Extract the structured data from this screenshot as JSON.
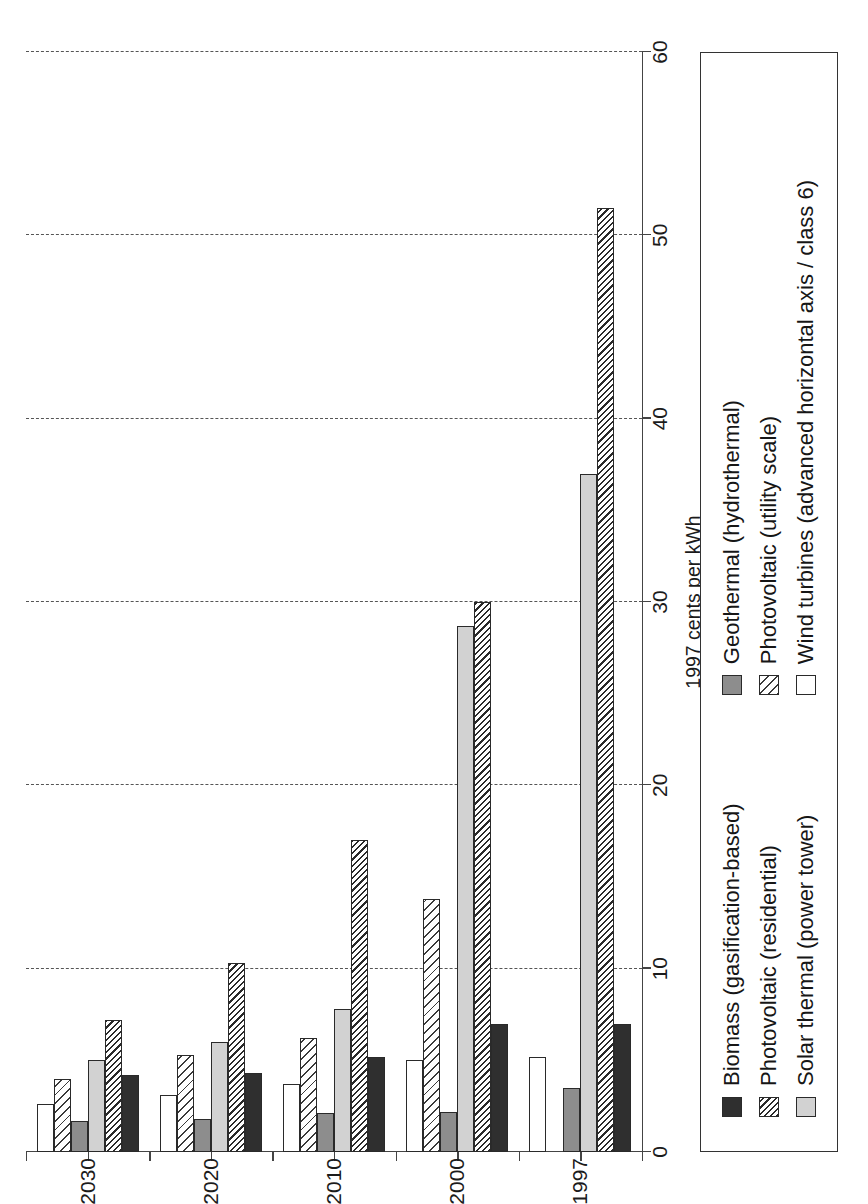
{
  "chart_data": {
    "type": "bar",
    "orientation": "horizontal",
    "title": "",
    "xlabel": "1997 cents per kWh",
    "ylabel": "",
    "categories": [
      "1997",
      "2000",
      "2010",
      "2020",
      "2030"
    ],
    "xlim": [
      0,
      60
    ],
    "xticks": [
      0,
      10,
      20,
      30,
      40,
      50,
      60
    ],
    "grid": true,
    "legend_position": "below-plot",
    "series": [
      {
        "name": "Biomass (gasification-based)",
        "fill": "solid-dark",
        "values": [
          7.0,
          7.0,
          5.2,
          4.3,
          4.2
        ]
      },
      {
        "name": "Photovoltaic (residential)",
        "fill": "dense-hatch",
        "values": [
          51.5,
          30.0,
          17.0,
          10.3,
          7.2
        ]
      },
      {
        "name": "Solar thermal (power tower)",
        "fill": "light-tone",
        "values": [
          37.0,
          28.7,
          7.8,
          6.0,
          5.0
        ]
      },
      {
        "name": "Geothermal (hydrothermal)",
        "fill": "mid-tone",
        "values": [
          3.5,
          2.2,
          2.1,
          1.8,
          1.7
        ]
      },
      {
        "name": "Photovoltaic (utility scale)",
        "fill": "open-hatch",
        "values": [
          0.0,
          13.8,
          6.2,
          5.3,
          4.0
        ]
      },
      {
        "name": "Wind turbines (advanced horizontal axis / class 6)",
        "fill": "white",
        "values": [
          5.2,
          5.0,
          3.7,
          3.1,
          2.6
        ]
      }
    ]
  },
  "axes": {
    "value_axis_title": "1997 cents per kWh",
    "value_tick_labels": [
      "0",
      "10",
      "20",
      "30",
      "40",
      "50",
      "60"
    ],
    "category_tick_labels": [
      "1997",
      "2000",
      "2010",
      "2020",
      "2030"
    ]
  },
  "legend": {
    "column_one": [
      "Biomass (gasification-based)",
      "Photovoltaic (residential)",
      "Solar thermal (power tower)"
    ],
    "column_two": [
      "Geothermal (hydrothermal)",
      "Photovoltaic (utility scale)",
      "Wind turbines (advanced horizontal axis / class 6)"
    ]
  },
  "colors": {
    "axis": "#444444",
    "grid": "#555555",
    "biomass": "#2f2f2f",
    "solar_thermal": "#d2d2d2",
    "geothermal": "#8d8d8d",
    "wind": "#ffffff",
    "text": "#1b1b1b"
  }
}
